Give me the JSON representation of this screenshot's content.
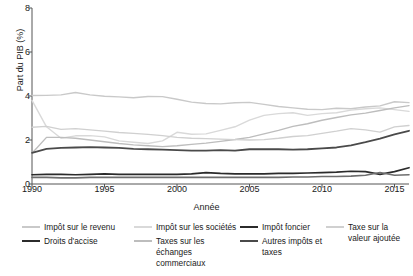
{
  "chart_data": {
    "type": "line",
    "title": "",
    "xlabel": "Année",
    "ylabel": "Part du PIB (%)",
    "xlim": [
      1990,
      2016
    ],
    "ylim": [
      0,
      8
    ],
    "xticks": [
      1990,
      1995,
      2000,
      2005,
      2010,
      2015
    ],
    "yticks": [
      0,
      2,
      4,
      6,
      8
    ],
    "grid": false,
    "legend_position": "below",
    "x": [
      1990,
      1991,
      1992,
      1993,
      1994,
      1995,
      1996,
      1997,
      1998,
      1999,
      2000,
      2001,
      2002,
      2003,
      2004,
      2005,
      2006,
      2007,
      2008,
      2009,
      2010,
      2011,
      2012,
      2013,
      2014,
      2015,
      2016
    ],
    "series": [
      {
        "name": "Impôt sur le revenu",
        "color": "#c9c9c9",
        "width": 1.4,
        "values": [
          4.02,
          4.03,
          4.05,
          4.16,
          4.05,
          3.99,
          3.96,
          3.92,
          3.98,
          3.97,
          3.85,
          3.72,
          3.66,
          3.64,
          3.69,
          3.71,
          3.62,
          3.52,
          3.46,
          3.4,
          3.38,
          3.44,
          3.42,
          3.5,
          3.55,
          3.74,
          3.7
        ]
      },
      {
        "name": "Impôt sur les sociétés",
        "color": "#d9d9d9",
        "width": 1.4,
        "values": [
          3.8,
          2.6,
          2.08,
          2.19,
          2.2,
          2.14,
          1.96,
          1.9,
          1.84,
          1.96,
          2.35,
          2.26,
          2.28,
          2.44,
          2.6,
          2.9,
          3.12,
          3.2,
          3.24,
          3.12,
          3.2,
          3.24,
          3.36,
          3.42,
          3.46,
          3.38,
          3.3
        ]
      },
      {
        "name": "Taxes sur les échanges commerciaux",
        "color": "#bdbdbd",
        "width": 1.4,
        "values": [
          1.4,
          2.12,
          2.12,
          2.08,
          2.0,
          1.92,
          1.84,
          1.78,
          1.74,
          1.7,
          1.74,
          1.8,
          1.86,
          1.94,
          2.02,
          2.12,
          2.28,
          2.44,
          2.62,
          2.74,
          2.9,
          3.02,
          3.14,
          3.22,
          3.34,
          3.46,
          3.56
        ]
      },
      {
        "name": "Taxe sur la valeur ajoutée",
        "color": "#d0d0d0",
        "width": 1.3,
        "values": [
          2.58,
          2.62,
          2.48,
          2.52,
          2.46,
          2.4,
          2.34,
          2.3,
          2.26,
          2.2,
          2.12,
          2.08,
          2.06,
          2.04,
          2.02,
          2.0,
          2.02,
          2.08,
          2.16,
          2.2,
          2.3,
          2.4,
          2.52,
          2.46,
          2.36,
          2.6,
          2.66
        ]
      },
      {
        "name": "Droits d'accise",
        "color": "#4a4a4a",
        "width": 1.8,
        "values": [
          1.42,
          1.6,
          1.64,
          1.66,
          1.68,
          1.66,
          1.64,
          1.6,
          1.58,
          1.56,
          1.54,
          1.52,
          1.52,
          1.54,
          1.52,
          1.58,
          1.58,
          1.58,
          1.56,
          1.58,
          1.62,
          1.66,
          1.76,
          1.9,
          2.06,
          2.26,
          2.42
        ]
      },
      {
        "name": "Impôt foncier",
        "color": "#2b2b2b",
        "width": 1.7,
        "values": [
          0.42,
          0.44,
          0.44,
          0.42,
          0.44,
          0.46,
          0.44,
          0.44,
          0.44,
          0.44,
          0.44,
          0.46,
          0.52,
          0.48,
          0.46,
          0.46,
          0.46,
          0.48,
          0.48,
          0.5,
          0.52,
          0.54,
          0.58,
          0.56,
          0.44,
          0.56,
          0.74
        ]
      },
      {
        "name": "Autres impôts et taxes",
        "color": "#6e6e6e",
        "width": 1.6,
        "values": [
          0.3,
          0.3,
          0.28,
          0.28,
          0.3,
          0.3,
          0.3,
          0.3,
          0.3,
          0.3,
          0.3,
          0.3,
          0.3,
          0.3,
          0.3,
          0.3,
          0.3,
          0.3,
          0.32,
          0.32,
          0.34,
          0.34,
          0.36,
          0.4,
          0.52,
          0.4,
          0.42
        ]
      }
    ]
  },
  "axes": {
    "ylabel": "Part du PIB (%)",
    "xlabel": "Année",
    "ytick_labels": [
      "0",
      "2",
      "4",
      "6",
      "8"
    ],
    "xtick_labels": [
      "1990",
      "1995",
      "2000",
      "2005",
      "2010",
      "2015"
    ]
  },
  "legend": {
    "columns": [
      {
        "left": 22,
        "width": 112,
        "entries": [
          {
            "label": "Impôt sur le revenu",
            "color": "#c9c9c9",
            "thick": false
          },
          {
            "label": "Droits d'accise",
            "color": "#2b2b2b",
            "thick": true
          }
        ]
      },
      {
        "left": 134,
        "width": 104,
        "entries": [
          {
            "label": "Impôt sur les sociétés",
            "color": "#d9d9d9",
            "thick": false
          },
          {
            "label": "Taxes sur les échanges commerciaux",
            "color": "#bdbdbd",
            "thick": false
          }
        ]
      },
      {
        "left": 240,
        "width": 84,
        "entries": [
          {
            "label": "Impôt foncier",
            "color": "#2b2b2b",
            "thick": true
          },
          {
            "label": "Autres impôts et taxes",
            "color": "#4a4a4a",
            "thick": true
          }
        ]
      },
      {
        "left": 326,
        "width": 86,
        "entries": [
          {
            "label": "Taxe sur la valeur ajoutée",
            "color": "#d0d0d0",
            "thick": false
          }
        ]
      }
    ]
  },
  "style": {
    "background": "#ffffff",
    "axis_color": "#555555",
    "text_color": "#1a1a1a"
  }
}
